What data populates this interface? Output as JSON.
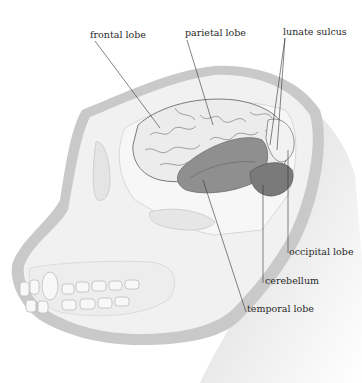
{
  "diagram": {
    "labels": [
      {
        "id": "frontal",
        "text": "frontal lobe"
      },
      {
        "id": "parietal",
        "text": "parietal lobe"
      },
      {
        "id": "lunate",
        "text": "lunate sulcus"
      },
      {
        "id": "occipital",
        "text": "occipital lobe"
      },
      {
        "id": "cerebellum",
        "text": "cerebellum"
      },
      {
        "id": "temporal",
        "text": "temporal lobe"
      }
    ],
    "colors": {
      "skull_outline": "#c9c9c9",
      "skull_fill": "#f1f1f1",
      "brain_cortex": "#ececec",
      "temporal_lobe": "#8f8f8f",
      "cerebellum": "#7a7a7a",
      "neck_shadow": "#d4d4d4",
      "leader_line": "#333333"
    }
  }
}
